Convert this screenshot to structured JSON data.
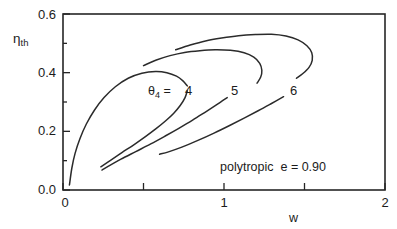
{
  "chart_data": {
    "type": "line",
    "title": "",
    "subtitle": "",
    "xlabel": "w",
    "ylabel": "ηth",
    "ylabel_base": "η",
    "ylabel_sub": "th",
    "xlim": [
      0,
      2
    ],
    "ylim": [
      0.0,
      0.6
    ],
    "grid": false,
    "legend_position": "inline-curve-labels",
    "x_ticks_major": [
      0,
      1,
      2
    ],
    "x_tick_labels": [
      "0",
      "1",
      "2"
    ],
    "x_ticks_minor": [
      0.5,
      1.5
    ],
    "y_ticks_major": [
      0.0,
      0.2,
      0.4,
      0.6
    ],
    "y_tick_labels": [
      "0.0",
      "0.2",
      "0.4",
      "0.6"
    ],
    "y_ticks_minor": [
      0.1,
      0.3,
      0.5
    ],
    "annotations": [
      {
        "name": "polytropic-note",
        "text": "polytropic   e = 0.90",
        "x": 1.05,
        "y": 0.085
      }
    ],
    "parameter_symbol": "θ",
    "parameter_subscript": "4",
    "parameter_prefix": "θ₄ =",
    "series": [
      {
        "name": "theta4 = 4",
        "label": "4",
        "label_x": 0.82,
        "label_y": 0.345,
        "upper_branch": [
          [
            0.04,
            0.017
          ],
          [
            0.055,
            0.075
          ],
          [
            0.075,
            0.125
          ],
          [
            0.105,
            0.175
          ],
          [
            0.145,
            0.225
          ],
          [
            0.195,
            0.272
          ],
          [
            0.255,
            0.315
          ],
          [
            0.325,
            0.352
          ],
          [
            0.405,
            0.381
          ],
          [
            0.49,
            0.398
          ],
          [
            0.575,
            0.404
          ],
          [
            0.645,
            0.4
          ],
          [
            0.705,
            0.388
          ],
          [
            0.745,
            0.372
          ],
          [
            0.772,
            0.355
          ]
        ],
        "lower_branch": [
          [
            0.772,
            0.338
          ],
          [
            0.758,
            0.315
          ],
          [
            0.728,
            0.288
          ],
          [
            0.688,
            0.262
          ],
          [
            0.638,
            0.236
          ],
          [
            0.578,
            0.209
          ],
          [
            0.512,
            0.182
          ],
          [
            0.442,
            0.155
          ],
          [
            0.368,
            0.128
          ],
          [
            0.295,
            0.101
          ],
          [
            0.235,
            0.079
          ]
        ]
      },
      {
        "name": "theta4 = 5",
        "label": "5",
        "label_x": 1.1,
        "label_y": 0.345,
        "upper_branch": [
          [
            0.5,
            0.424
          ],
          [
            0.58,
            0.443
          ],
          [
            0.665,
            0.458
          ],
          [
            0.755,
            0.469
          ],
          [
            0.85,
            0.475
          ],
          [
            0.945,
            0.478
          ],
          [
            1.04,
            0.476
          ],
          [
            1.125,
            0.468
          ],
          [
            1.185,
            0.453
          ],
          [
            1.222,
            0.432
          ],
          [
            1.235,
            0.408
          ],
          [
            1.228,
            0.385
          ],
          [
            1.205,
            0.364
          ]
        ],
        "lower_branch": [
          [
            1.02,
            0.315
          ],
          [
            0.955,
            0.291
          ],
          [
            0.882,
            0.265
          ],
          [
            0.805,
            0.238
          ],
          [
            0.722,
            0.211
          ],
          [
            0.635,
            0.184
          ],
          [
            0.545,
            0.157
          ],
          [
            0.452,
            0.131
          ],
          [
            0.36,
            0.105
          ],
          [
            0.285,
            0.082
          ],
          [
            0.242,
            0.068
          ]
        ]
      },
      {
        "name": "theta4 = 6",
        "label": "6",
        "label_x": 1.47,
        "label_y": 0.345,
        "upper_branch": [
          [
            0.7,
            0.478
          ],
          [
            0.79,
            0.494
          ],
          [
            0.885,
            0.508
          ],
          [
            0.985,
            0.518
          ],
          [
            1.09,
            0.526
          ],
          [
            1.195,
            0.53
          ],
          [
            1.295,
            0.531
          ],
          [
            1.385,
            0.525
          ],
          [
            1.46,
            0.512
          ],
          [
            1.515,
            0.492
          ],
          [
            1.545,
            0.468
          ],
          [
            1.548,
            0.442
          ],
          [
            1.528,
            0.418
          ],
          [
            1.49,
            0.397
          ],
          [
            1.45,
            0.381
          ]
        ],
        "lower_branch": [
          [
            1.37,
            0.318
          ],
          [
            1.295,
            0.295
          ],
          [
            1.215,
            0.271
          ],
          [
            1.128,
            0.246
          ],
          [
            1.035,
            0.22
          ],
          [
            0.938,
            0.194
          ],
          [
            0.838,
            0.169
          ],
          [
            0.738,
            0.146
          ],
          [
            0.655,
            0.13
          ],
          [
            0.6,
            0.122
          ]
        ]
      }
    ]
  },
  "axes": {
    "y_title_base": "η",
    "y_title_sub": "th",
    "x_title": "w"
  },
  "labels": {
    "theta_prefix_symbol": "θ",
    "theta_prefix_sub": "4",
    "theta_prefix_eq": "=",
    "curve_4": "4",
    "curve_5": "5",
    "curve_6": "6",
    "polytropic_text": "polytropic",
    "e_text": "e = 0.90"
  },
  "tick_labels": {
    "y": [
      "0.0",
      "0.2",
      "0.4",
      "0.6"
    ],
    "x": [
      "0",
      "1",
      "2"
    ]
  },
  "colors": {
    "curve": "#2b2b2b",
    "axis": "#262626",
    "text": "#1c1c1c",
    "background": "#ffffff"
  }
}
